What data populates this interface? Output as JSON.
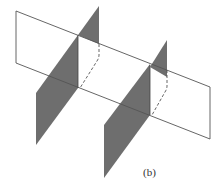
{
  "figure": {
    "label": "(b)",
    "colors": {
      "background": "#ffffff",
      "plane_fill": "#6e6e6e",
      "outline": "#555555",
      "hidden_edge": "#555555"
    }
  }
}
